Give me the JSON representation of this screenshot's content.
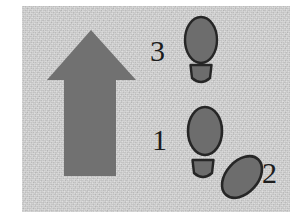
{
  "figure": {
    "kind": "footstep-direction-diagram",
    "background_color": "#c9c9c9",
    "ink_color": "#6f6f6f",
    "outline_color": "#2a2a2a",
    "label_color": "#1c1c1c",
    "panel": {
      "x": 22,
      "y": 6,
      "width": 268,
      "height": 206
    }
  },
  "arrow": {
    "name": "direction-of-travel-arrow",
    "points_toward": "up",
    "fill": "#717171",
    "apex": {
      "x": 91,
      "y": 30
    },
    "head_left": {
      "x": 47,
      "y": 80
    },
    "head_right": {
      "x": 136,
      "y": 80
    },
    "shaft": {
      "left": 64,
      "right": 116,
      "top": 80,
      "bottom": 176
    }
  },
  "labels": [
    {
      "id": "label-3",
      "text": "3",
      "x": 150,
      "y": 36
    },
    {
      "id": "label-1",
      "text": "1",
      "x": 152,
      "y": 125
    },
    {
      "id": "label-2",
      "text": "2",
      "x": 262,
      "y": 158
    }
  ],
  "footprints": [
    {
      "id": "footprint-3",
      "label": "3",
      "step_number": 3,
      "orientation_deg": 0,
      "sole": {
        "cx": 201,
        "cy": 40,
        "rx": 16,
        "ry": 23
      },
      "heel": {
        "cx": 201,
        "cy": 75,
        "rx": 11,
        "ry": 10
      }
    },
    {
      "id": "footprint-1",
      "label": "1",
      "step_number": 1,
      "orientation_deg": 0,
      "sole": {
        "cx": 205,
        "cy": 131,
        "rx": 17,
        "ry": 24
      },
      "heel": {
        "cx": 203,
        "cy": 170,
        "rx": 11,
        "ry": 10
      }
    },
    {
      "id": "footprint-2",
      "label": "2",
      "step_number": 2,
      "orientation_deg": 42,
      "sole": {
        "cx": 242,
        "cy": 177,
        "rx": 16,
        "ry": 24
      },
      "heel": null
    }
  ]
}
